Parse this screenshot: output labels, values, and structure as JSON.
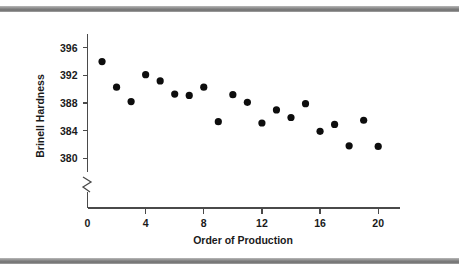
{
  "figure": {
    "background_color": "#ffffff",
    "top_rule_color": "#8e8e8e",
    "bottom_rule_color": "#8e8e8e"
  },
  "chart_data": {
    "type": "scatter",
    "title": "",
    "xlabel": "Order of Production",
    "ylabel": "Brinell Hardness",
    "xlim": [
      0,
      21.5
    ],
    "ylim": [
      378,
      398
    ],
    "xticks": [
      0,
      4,
      8,
      12,
      16,
      20
    ],
    "xticklabels": [
      "0",
      "4",
      "8",
      "12",
      "16",
      "20"
    ],
    "yticks": [
      380,
      384,
      388,
      392,
      396
    ],
    "yticklabels": [
      "380",
      "384",
      "388",
      "392",
      "396"
    ],
    "grid": false,
    "legend": false,
    "y_axis_break": true,
    "marker": "filled-circle",
    "marker_color": "#0d0d0d",
    "x": [
      1,
      2,
      3,
      4,
      5,
      6,
      7,
      8,
      9,
      10,
      11,
      12,
      13,
      14,
      15,
      16,
      17,
      18,
      19,
      20
    ],
    "y": [
      394.0,
      390.3,
      388.2,
      392.1,
      391.2,
      389.3,
      389.1,
      390.3,
      385.3,
      389.2,
      388.1,
      385.1,
      387.0,
      385.9,
      387.9,
      383.9,
      384.9,
      381.8,
      385.5,
      381.7
    ],
    "points": [
      {
        "x": 1,
        "y": 394.0
      },
      {
        "x": 2,
        "y": 390.3
      },
      {
        "x": 3,
        "y": 388.2
      },
      {
        "x": 4,
        "y": 392.1
      },
      {
        "x": 5,
        "y": 391.2
      },
      {
        "x": 6,
        "y": 389.3
      },
      {
        "x": 7,
        "y": 389.1
      },
      {
        "x": 8,
        "y": 390.3
      },
      {
        "x": 9,
        "y": 385.3
      },
      {
        "x": 10,
        "y": 389.2
      },
      {
        "x": 11,
        "y": 388.1
      },
      {
        "x": 12,
        "y": 385.1
      },
      {
        "x": 13,
        "y": 387.0
      },
      {
        "x": 14,
        "y": 385.9
      },
      {
        "x": 15,
        "y": 387.9
      },
      {
        "x": 16,
        "y": 383.9
      },
      {
        "x": 17,
        "y": 384.9
      },
      {
        "x": 18,
        "y": 381.8
      },
      {
        "x": 19,
        "y": 385.5
      },
      {
        "x": 20,
        "y": 381.7
      }
    ]
  }
}
